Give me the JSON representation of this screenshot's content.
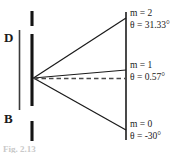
{
  "figure": {
    "background_color": "#ffffff",
    "stroke_color": "#1a1a1a",
    "caption": "Fig. 2.13"
  },
  "left_labels": {
    "detector": "D",
    "beam": "B"
  },
  "orders": [
    {
      "id": "m2",
      "order_label": "m = 2",
      "angle_label": "θ = 31.33°",
      "order_value": 2,
      "angle_degrees": 31.33
    },
    {
      "id": "m1",
      "order_label": "m = 1",
      "angle_label": "θ = 0.57°",
      "order_value": 1,
      "angle_degrees": 0.57
    },
    {
      "id": "m0",
      "order_label": "m = 0",
      "angle_label": "θ = -30°",
      "order_value": 0,
      "angle_degrees": -30
    }
  ],
  "geometry": {
    "source_point": {
      "x": 33,
      "y": 78
    },
    "screen_line": {
      "x": 126,
      "y_top": 12,
      "y_bottom": 140
    },
    "grating_line_x": 32,
    "aperture_line_x": 19,
    "ray_endpoints": {
      "m2": {
        "x": 126,
        "y": 18
      },
      "m1": {
        "x": 126,
        "y": 70
      },
      "m0": {
        "x": 126,
        "y": 130
      }
    },
    "dashed_reference_end": {
      "x": 126,
      "y": 78
    }
  }
}
